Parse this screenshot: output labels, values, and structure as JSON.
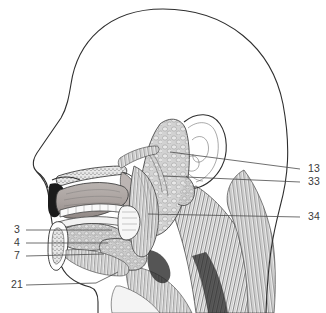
{
  "figure": {
    "kind": "anatomical-illustration",
    "view": "lateral sagittal head and neck",
    "background_color": "#ffffff",
    "line_color": "#2e2e2e",
    "label_color": "#3a3a3a"
  },
  "labels": {
    "right": [
      {
        "id": "label-13",
        "text": "13",
        "x": 308,
        "y": 172
      },
      {
        "id": "label-33",
        "text": "33",
        "x": 308,
        "y": 185
      },
      {
        "id": "label-34",
        "text": "34",
        "x": 308,
        "y": 220
      }
    ],
    "left": [
      {
        "id": "label-3",
        "text": "3",
        "x": 14,
        "y": 233
      },
      {
        "id": "label-4",
        "text": "4",
        "x": 14,
        "y": 246
      },
      {
        "id": "label-7",
        "text": "7",
        "x": 14,
        "y": 259
      },
      {
        "id": "label-21",
        "text": "21",
        "x": 11,
        "y": 288
      }
    ]
  },
  "leaders": {
    "right": [
      {
        "id": "leader-13",
        "d": "M 300 169 L 170 152"
      },
      {
        "id": "leader-33",
        "d": "M 300 182 L 163 176"
      },
      {
        "id": "leader-34",
        "d": "M 300 217 L 148 214"
      }
    ],
    "left": [
      {
        "id": "leader-3",
        "d": "M 26 230 L 112 230"
      },
      {
        "id": "leader-4",
        "d": "M 26 243 L 108 243"
      },
      {
        "id": "leader-7",
        "d": "M 26 256 L 104 254"
      },
      {
        "id": "leader-21",
        "d": "M 26 285 L 96 283 L 118 272"
      }
    ]
  },
  "structures": {
    "cranium": "skull and scalp profile outline",
    "face": "forehead, nose, lips and chin profile",
    "ear": "auricle pinna line art",
    "parotid_gland": "large lobulated gland anterior to ear",
    "tongue": "tongue body within oral cavity",
    "teeth": "upper and lower dental arch",
    "hard_palate": "roof of mouth with stippled bone",
    "soft_palate": "posterior palate and pharyngeal wall",
    "sublingual_gland": "gland under the tongue",
    "submandibular_gland": "gland below mandible angle",
    "mandible": "lower jaw bone in cross-section",
    "sternocleidomastoid": "striated neck muscle",
    "pharynx": "throat passage with striated constrictors"
  }
}
